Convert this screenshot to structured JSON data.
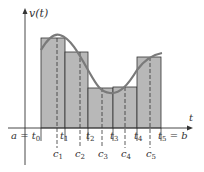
{
  "diagram": {
    "type": "riemann-sum-midpoint",
    "y_axis_label": "v(t)",
    "x_axis_label": "t",
    "colors": {
      "rect_fill": "#b8b8b8",
      "rect_stroke": "#333333",
      "curve": "#777777",
      "axis": "#333333"
    },
    "partition_labels": [
      {
        "text": "a = t",
        "sub": "0"
      },
      {
        "text": "t",
        "sub": "1"
      },
      {
        "text": "t",
        "sub": "2"
      },
      {
        "text": "t",
        "sub": "3"
      },
      {
        "text": "t",
        "sub": "4"
      },
      {
        "text": "t",
        "sub": "5",
        "suffix": " = b"
      }
    ],
    "sample_labels": [
      {
        "text": "c",
        "sub": "1"
      },
      {
        "text": "c",
        "sub": "2"
      },
      {
        "text": "c",
        "sub": "3"
      },
      {
        "text": "c",
        "sub": "4"
      },
      {
        "text": "c",
        "sub": "5"
      }
    ],
    "rectangles": [
      {
        "x0": 41,
        "x1": 65,
        "top": 38,
        "c": 57
      },
      {
        "x0": 65,
        "x1": 88,
        "top": 52,
        "c": 80
      },
      {
        "x0": 88,
        "x1": 113,
        "top": 88,
        "c": 102
      },
      {
        "x0": 113,
        "x1": 137,
        "top": 87,
        "c": 125
      },
      {
        "x0": 137,
        "x1": 161,
        "top": 57,
        "c": 150
      }
    ]
  }
}
